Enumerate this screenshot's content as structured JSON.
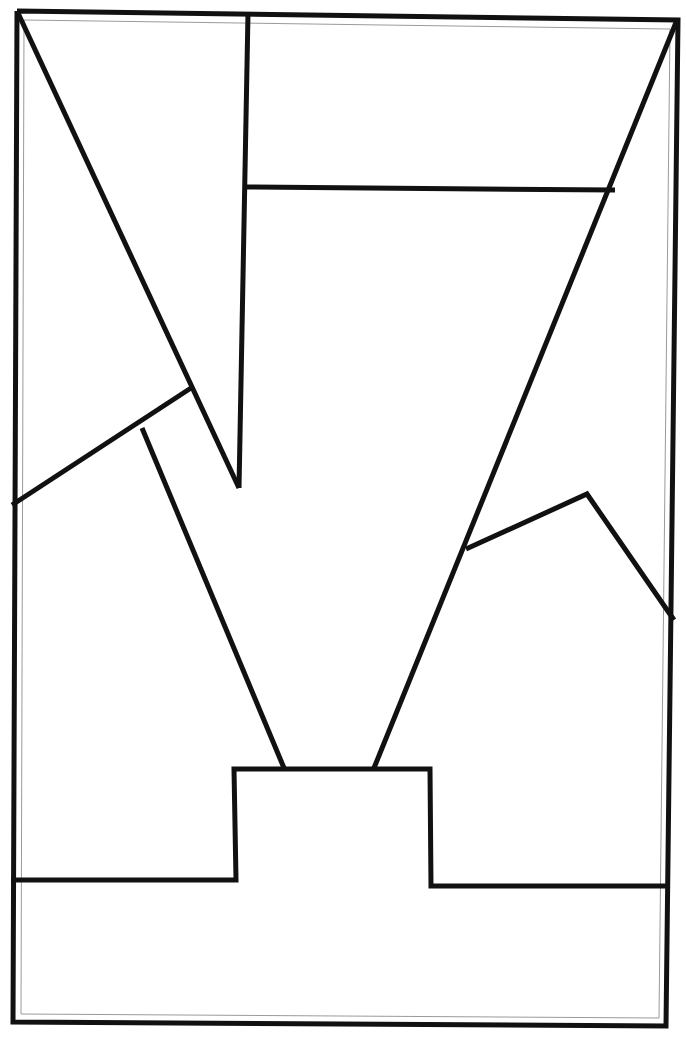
{
  "document": {
    "title": "Geometric Line Drawing",
    "background_color": "#ffffff",
    "ink_color": "#111111",
    "inner_guide_color": "#9a9a9a",
    "width": 686,
    "height": 1039
  },
  "drawing": {
    "type": "line-art",
    "description": "Hand-traced black line drawing of an abstract angular figure inside a slightly skewed rectangular border",
    "default_stroke_width": 5,
    "border": {
      "name": "outer-frame",
      "stroke_width": 5,
      "points": [
        [
          17,
          11
        ],
        [
          678,
          20
        ],
        [
          666,
          1026
        ],
        [
          13,
          1022
        ]
      ],
      "closed": true
    },
    "inner_border": {
      "name": "inner-frame-guide",
      "stroke_width": 1,
      "points": [
        [
          24,
          20
        ],
        [
          670,
          29
        ],
        [
          659,
          1018
        ],
        [
          21,
          1014
        ]
      ],
      "closed": true
    },
    "segments": [
      {
        "name": "main-diagonal-left",
        "stroke_width": 5,
        "points": [
          [
            18,
            13
          ],
          [
            239,
            488
          ]
        ],
        "closed": false
      },
      {
        "name": "vertical-upper-left",
        "stroke_width": 5,
        "points": [
          [
            248,
            13
          ],
          [
            239,
            488
          ]
        ],
        "closed": false
      },
      {
        "name": "horizontal-crossbar",
        "stroke_width": 5,
        "points": [
          [
            246,
            187
          ],
          [
            615,
            190
          ]
        ],
        "closed": false
      },
      {
        "name": "main-diagonal-right",
        "stroke_width": 5,
        "points": [
          [
            677,
            20
          ],
          [
            374,
            768
          ]
        ],
        "closed": false
      },
      {
        "name": "zigzag-left-slope",
        "stroke_width": 5,
        "points": [
          [
            12,
            505
          ],
          [
            191,
            388
          ]
        ],
        "closed": false
      },
      {
        "name": "inner-left-descender",
        "stroke_width": 5,
        "points": [
          [
            142,
            428
          ],
          [
            284,
            768
          ]
        ],
        "closed": false
      },
      {
        "name": "right-mountain",
        "stroke_width": 5,
        "points": [
          [
            466,
            549
          ],
          [
            587,
            494
          ],
          [
            674,
            620
          ]
        ],
        "closed": false
      },
      {
        "name": "pedestal-step",
        "stroke_width": 5,
        "points": [
          [
            11,
            880
          ],
          [
            236,
            880
          ],
          [
            234,
            769
          ],
          [
            430,
            769
          ],
          [
            431,
            886
          ],
          [
            668,
            886
          ]
        ],
        "closed": false
      }
    ],
    "vertices": [
      {
        "name": "frame-top-left",
        "x": 17,
        "y": 11
      },
      {
        "name": "frame-top-right",
        "x": 678,
        "y": 20
      },
      {
        "name": "frame-bottom-right",
        "x": 666,
        "y": 1026
      },
      {
        "name": "frame-bottom-left",
        "x": 13,
        "y": 1022
      },
      {
        "name": "v-notch-tip",
        "x": 239,
        "y": 488
      },
      {
        "name": "crossbar-left-end",
        "x": 246,
        "y": 187
      },
      {
        "name": "crossbar-right-end",
        "x": 615,
        "y": 190
      },
      {
        "name": "zigzag-peak",
        "x": 191,
        "y": 388
      },
      {
        "name": "zigzag-left-edge",
        "x": 12,
        "y": 505
      },
      {
        "name": "descender-branch",
        "x": 142,
        "y": 428
      },
      {
        "name": "mountain-left-foot",
        "x": 466,
        "y": 549
      },
      {
        "name": "mountain-peak",
        "x": 587,
        "y": 494
      },
      {
        "name": "mountain-right-foot",
        "x": 674,
        "y": 620
      },
      {
        "name": "pedestal-top-left",
        "x": 234,
        "y": 769
      },
      {
        "name": "pedestal-top-right",
        "x": 430,
        "y": 769
      },
      {
        "name": "pedestal-base-left",
        "x": 236,
        "y": 880
      },
      {
        "name": "pedestal-base-right",
        "x": 431,
        "y": 886
      }
    ]
  }
}
